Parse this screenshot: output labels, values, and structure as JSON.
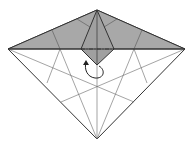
{
  "diagram": {
    "type": "origami-step",
    "colors": {
      "background": "#ffffff",
      "paper_colored": "#a8a8a8",
      "paper_white": "#ffffff",
      "line": "#333333",
      "crease": "#555555"
    },
    "shapes": {
      "outer_kite": "97,10 185,49 97,139 8,49",
      "colored_top": "97,10 185,49 8,49",
      "center_flap": "97,10 114,49 97,65 81,49"
    },
    "annotations": {
      "fold_arrow": "curved arrow indicating flip of center flap",
      "valley_line": "dash-dot line across flap"
    }
  }
}
